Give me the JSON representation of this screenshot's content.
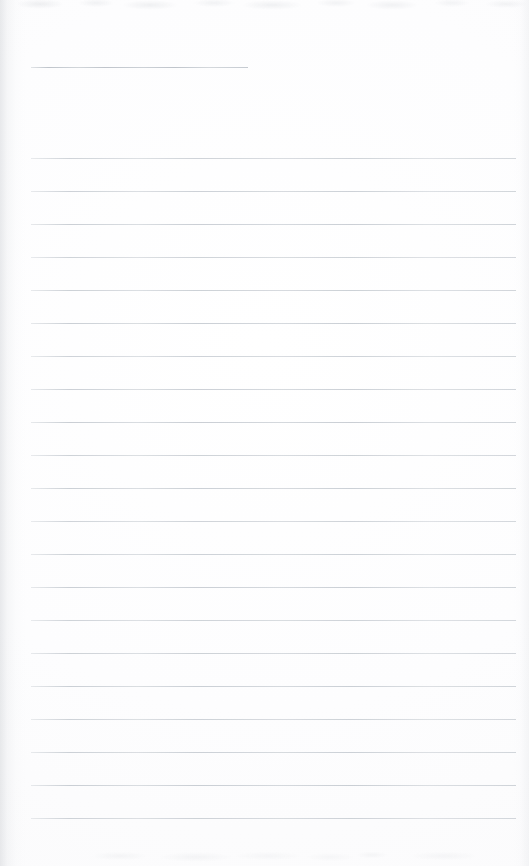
{
  "document": {
    "type": "scanned-ruled-notebook-page",
    "title": "Blank ruled notebook page",
    "page_width": 529,
    "page_height": 866,
    "background_color": "#fefefe",
    "written_text": "",
    "text_content_present": false
  },
  "rules": {
    "color": "#c9ced4",
    "short_rule_color": "#bcc2c9",
    "thickness_px": 1,
    "left_margin_x": 31,
    "right_end_x": 516,
    "line_spacing_px": 33,
    "first_full_line_y": 158,
    "full_line_count": 21,
    "header_rule": {
      "name": "header-rule",
      "y": 67,
      "x_start": 31,
      "x_end": 248
    },
    "full_line_y_positions": [
      158,
      191,
      224,
      257,
      290,
      323,
      356,
      389,
      422,
      455,
      488,
      521,
      554,
      587,
      620,
      653,
      686,
      719,
      752,
      785,
      818
    ]
  },
  "scan_artifacts": {
    "left_edge_shadow": true,
    "right_edge_shadow": true,
    "top_edge_noise": true,
    "bottom_edge_noise": true,
    "shadow_color": "#b6bac0"
  }
}
